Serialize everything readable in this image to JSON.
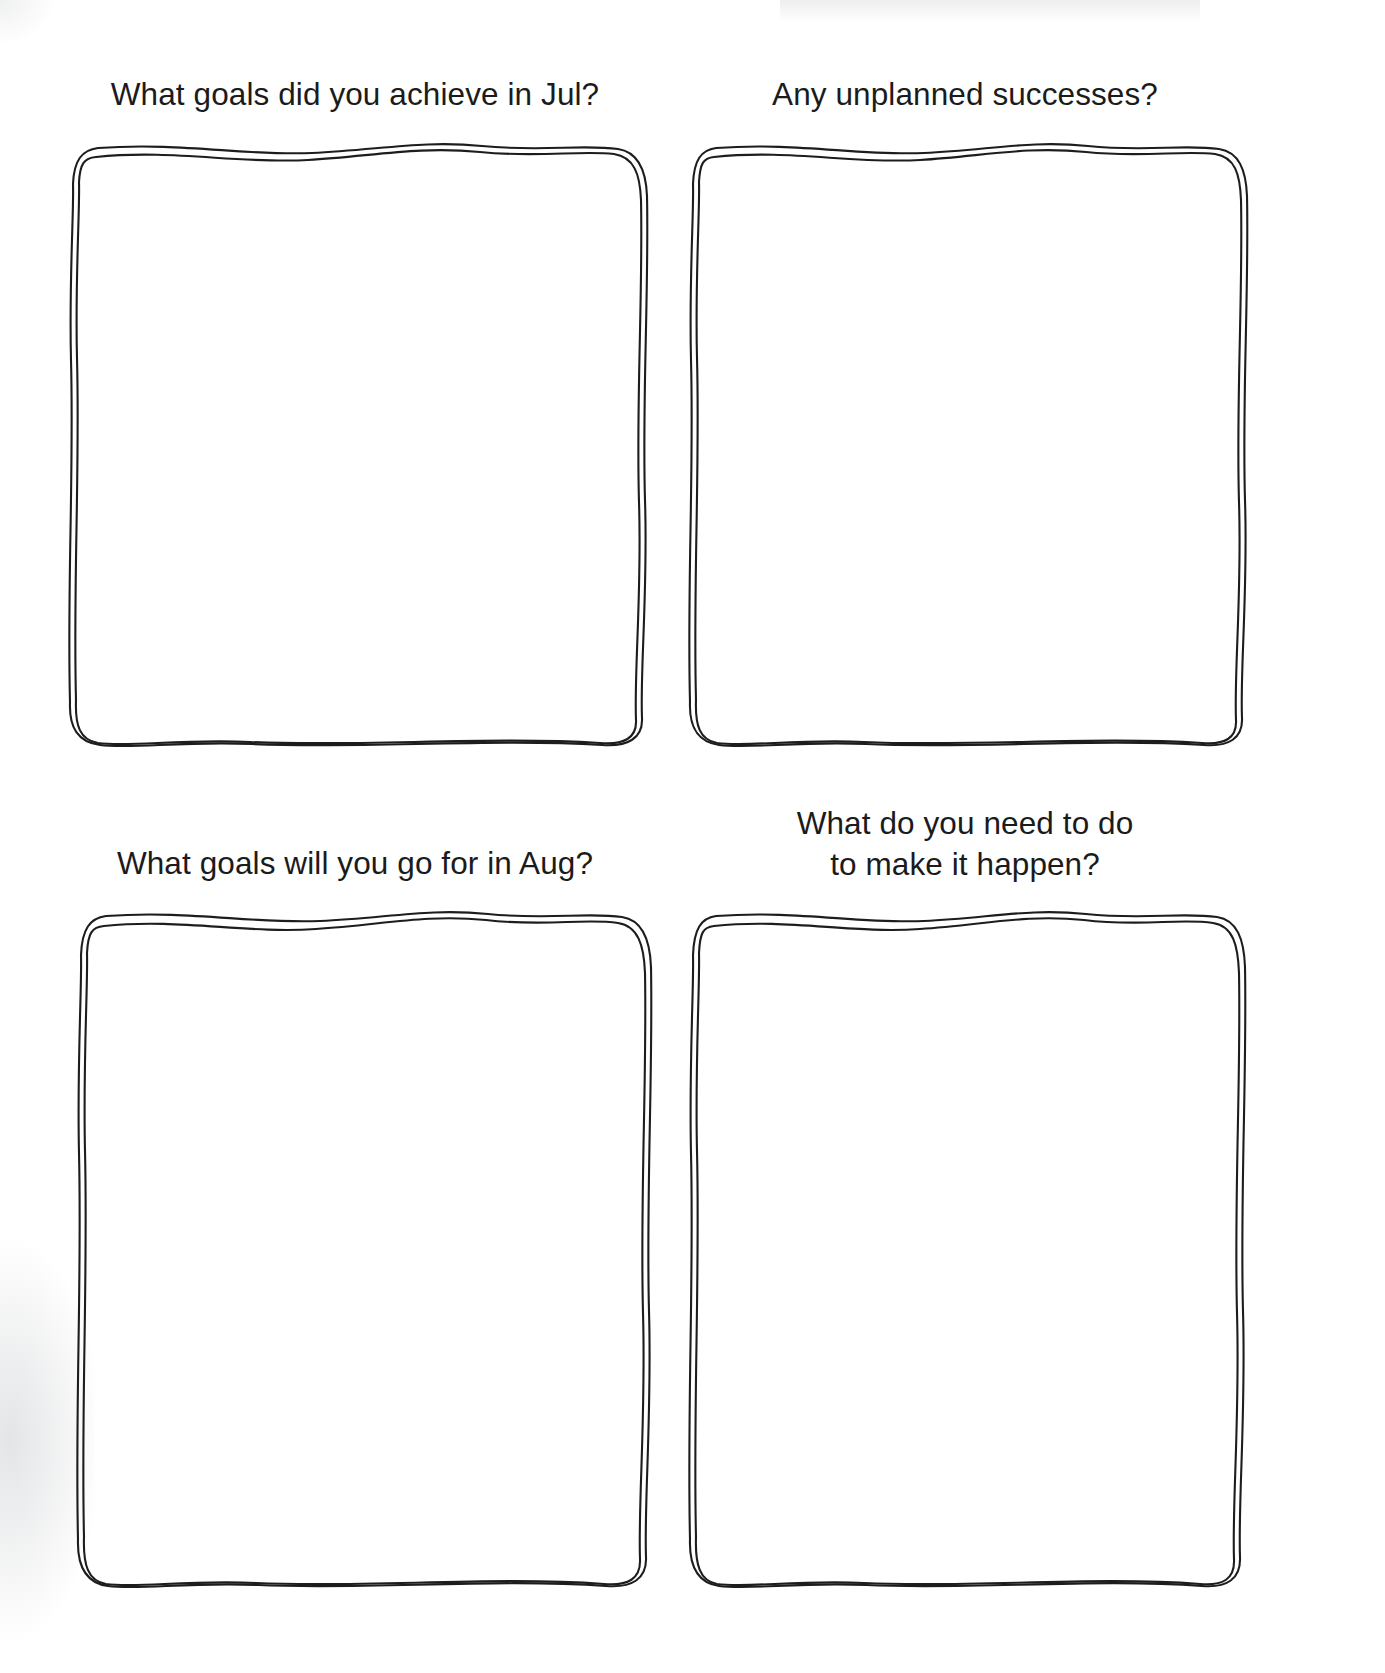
{
  "page": {
    "type": "worksheet",
    "background_color": "#ffffff",
    "ink_color": "#1d1d1d",
    "text_color": "#1b1b1b",
    "style": "hand-drawn sketch boxes"
  },
  "quadrants": [
    {
      "id": "q1",
      "label": "What goals did you achieve in Jul?",
      "answer_value": "",
      "placeholder": ""
    },
    {
      "id": "q2",
      "label": "Any unplanned successes?",
      "answer_value": "",
      "placeholder": ""
    },
    {
      "id": "q3",
      "label": "What goals will you go for in Aug?",
      "answer_value": "",
      "placeholder": ""
    },
    {
      "id": "q4",
      "label": "What do you need to do\nto make it happen?",
      "answer_value": "",
      "placeholder": ""
    }
  ]
}
